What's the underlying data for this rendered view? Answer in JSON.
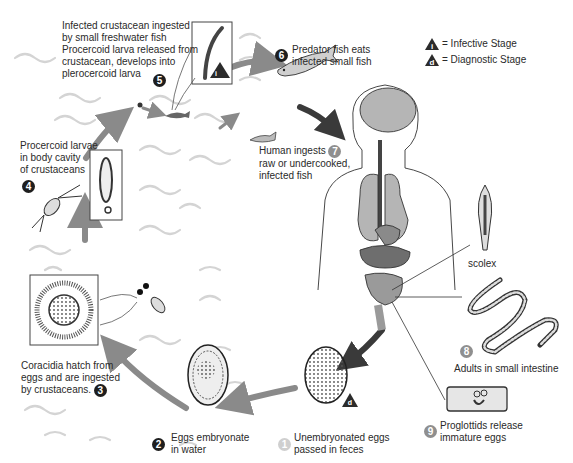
{
  "legend": {
    "infective": {
      "symbol": "i",
      "label": "= Infective Stage"
    },
    "diagnostic": {
      "symbol": "d",
      "label": "= Diagnostic Stage"
    }
  },
  "stages": [
    {
      "number": "1",
      "text": [
        "Unembryonated eggs",
        "passed in feces"
      ],
      "badge_style": "light"
    },
    {
      "number": "2",
      "text": [
        "Eggs embryonate",
        "in water"
      ],
      "badge_style": "dark"
    },
    {
      "number": "3",
      "text": [
        "Coracidia hatch from",
        "eggs and are ingested",
        "by crustaceans."
      ],
      "badge_style": "dark"
    },
    {
      "number": "4",
      "text": [
        "Procercoid larvae",
        "in body cavity",
        "of crustaceans"
      ],
      "badge_style": "dark"
    },
    {
      "number": "5",
      "text": [
        "Infected crustacean ingested",
        "by small freshwater fish",
        "Procercoid larva released from",
        "crustacean, develops into",
        "plerocercoid larva"
      ],
      "badge_style": "dark"
    },
    {
      "number": "6",
      "text": [
        "Predator fish eats",
        "infected small fish"
      ],
      "badge_style": "dark"
    },
    {
      "number": "7",
      "text": [
        "Human ingests",
        "raw or undercooked,",
        "infected fish"
      ],
      "badge_style": "gray"
    },
    {
      "number": "8",
      "text": [
        "Adults in small intestine"
      ],
      "badge_style": "gray"
    },
    {
      "number": "9",
      "text": [
        "Proglottids release",
        "immature eggs"
      ],
      "badge_style": "gray"
    }
  ],
  "annotations": {
    "scolex": "scolex"
  },
  "colors": {
    "arrow_gray": "#8a8a8a",
    "arrow_dark": "#3a3a3a",
    "wave": "#d4d4d4",
    "organ": "#a8a8a8",
    "organ_dark": "#6e6e6e",
    "badge_dark": "#1e1e1e",
    "badge_gray": "#8f8f8f",
    "badge_light": "#cfcfcf"
  }
}
